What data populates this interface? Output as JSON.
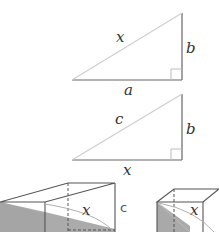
{
  "diagram": {
    "colors": {
      "line": "#555555",
      "hypotenuse": "#c8c8c8",
      "shade": "#a9a9a9",
      "label": "#333333"
    },
    "triangle1": {
      "hypotenuse_label": "x",
      "vertical_label": "b",
      "base_label": "a",
      "right_angle": true
    },
    "triangle2": {
      "hypotenuse_label": "c",
      "vertical_label": "b",
      "base_label": "x",
      "right_angle": true
    },
    "box_left": {
      "diagonal_label": "x",
      "edge_label": "c",
      "shaded": true
    },
    "box_right": {
      "diagonal_label": "x",
      "shaded": true
    }
  }
}
